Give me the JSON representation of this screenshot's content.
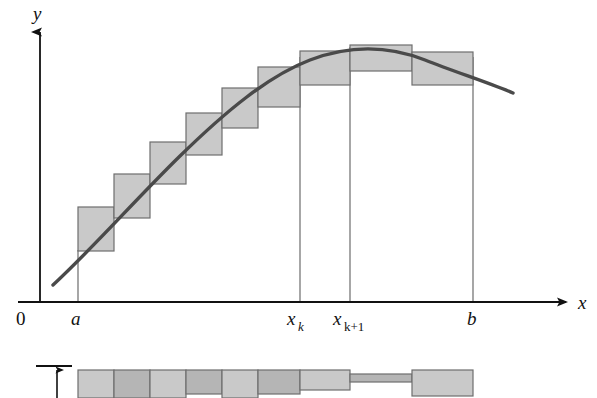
{
  "figure": {
    "background_color": "#ffffff",
    "axis_color": "#111111",
    "curve_color": "#4a4a4a",
    "rect_fill": "#c9c9c9",
    "rect_fill_alt": "#b5b5b5",
    "rect_stroke": "#6e6e6e",
    "guide_line_color": "#777777"
  },
  "axes": {
    "y_label": "y",
    "x_label": "x",
    "origin_label": "0",
    "y_axis_x": 40,
    "y_axis_top": 28,
    "y_axis_bottom": 302,
    "x_axis_y": 302,
    "x_axis_left": 18,
    "x_axis_right": 572
  },
  "ticks": [
    {
      "name": "a",
      "label": "a",
      "sub": "",
      "x": 78,
      "guide_top": 250
    },
    {
      "name": "x_k",
      "label": "x",
      "sub": "k",
      "x": 300,
      "guide_top": 57
    },
    {
      "name": "x_k_plus_1",
      "label": "x",
      "sub": "k+1",
      "x": 350,
      "guide_top": 47
    },
    {
      "name": "b",
      "label": "b",
      "sub": "",
      "x": 473,
      "guide_top": 57
    }
  ],
  "curve": {
    "description": "smooth concave-down curve rising from left then falling after peak",
    "path": "M 53 285 C 95 246 135 200 180 156 C 225 112 268 76 310 60 C 352 44 392 47 425 60 C 455 72 487 82 513 93",
    "stroke_width": 3.4
  },
  "rectangles": [
    {
      "index": 1,
      "x": 78,
      "y": 207,
      "width": 36,
      "height": 44,
      "shade": "light"
    },
    {
      "index": 2,
      "x": 114,
      "y": 174,
      "width": 36,
      "height": 44,
      "shade": "light"
    },
    {
      "index": 3,
      "x": 150,
      "y": 142,
      "width": 36,
      "height": 42,
      "shade": "light"
    },
    {
      "index": 4,
      "x": 186,
      "y": 113,
      "width": 36,
      "height": 42,
      "shade": "light"
    },
    {
      "index": 5,
      "x": 222,
      "y": 88,
      "width": 36,
      "height": 40,
      "shade": "light"
    },
    {
      "index": 6,
      "x": 258,
      "y": 67,
      "width": 42,
      "height": 40,
      "shade": "light"
    },
    {
      "index": 7,
      "x": 300,
      "y": 51,
      "width": 50,
      "height": 34,
      "shade": "light"
    },
    {
      "index": 8,
      "x": 350,
      "y": 45,
      "width": 62,
      "height": 26,
      "shade": "light"
    },
    {
      "index": 9,
      "x": 412,
      "y": 52,
      "width": 61,
      "height": 33,
      "shade": "light"
    }
  ],
  "bottom_strip": {
    "description": "unrolled partition strip showing the same subinterval widths",
    "baseline_y": 368,
    "marker": {
      "name": "height-arrow",
      "tick_x1": 36,
      "tick_x2": 72,
      "tick_y": 366,
      "arrow_x": 57,
      "arrow_top": 370,
      "arrow_bottom": 398
    },
    "cells": [
      {
        "index": 1,
        "x": 78,
        "y": 370,
        "width": 36,
        "height": 28,
        "shade": "light"
      },
      {
        "index": 2,
        "x": 114,
        "y": 370,
        "width": 36,
        "height": 28,
        "shade": "dark"
      },
      {
        "index": 3,
        "x": 150,
        "y": 370,
        "width": 36,
        "height": 28,
        "shade": "light"
      },
      {
        "index": 4,
        "x": 186,
        "y": 370,
        "width": 36,
        "height": 24,
        "shade": "dark"
      },
      {
        "index": 5,
        "x": 222,
        "y": 370,
        "width": 36,
        "height": 28,
        "shade": "light"
      },
      {
        "index": 6,
        "x": 258,
        "y": 370,
        "width": 42,
        "height": 24,
        "shade": "dark"
      },
      {
        "index": 7,
        "x": 300,
        "y": 370,
        "width": 50,
        "height": 20,
        "shade": "light"
      },
      {
        "index": 8,
        "x": 350,
        "y": 374,
        "width": 62,
        "height": 8,
        "shade": "dark"
      },
      {
        "index": 9,
        "x": 412,
        "y": 370,
        "width": 61,
        "height": 26,
        "shade": "light"
      }
    ]
  }
}
